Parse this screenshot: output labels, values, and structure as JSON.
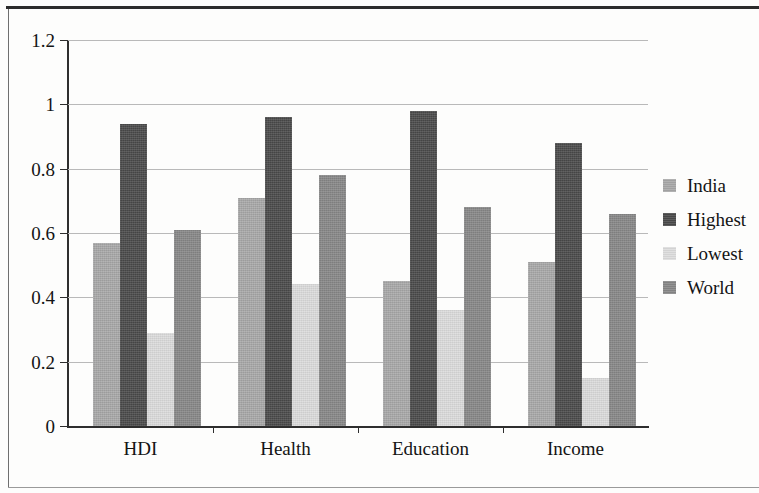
{
  "chart_data": {
    "type": "bar",
    "title": "",
    "xlabel": "",
    "ylabel": "",
    "categories": [
      "HDI",
      "Health",
      "Education",
      "Income"
    ],
    "series": [
      {
        "name": "India",
        "color": "#a8a8a8",
        "values": [
          0.57,
          0.71,
          0.45,
          0.51
        ]
      },
      {
        "name": "Highest",
        "color": "#4a4a4a",
        "values": [
          0.94,
          0.96,
          0.98,
          0.88
        ]
      },
      {
        "name": "Lowest",
        "color": "#dcdcdc",
        "values": [
          0.29,
          0.44,
          0.36,
          0.15
        ]
      },
      {
        "name": "World",
        "color": "#878787",
        "values": [
          0.61,
          0.78,
          0.68,
          0.66
        ]
      }
    ],
    "ylim": [
      0,
      1.2
    ],
    "yticks": [
      0,
      0.2,
      0.4,
      0.6,
      0.8,
      1,
      1.2
    ],
    "ytick_labels": [
      "0",
      "0.2",
      "0.4",
      "0.6",
      "0.8",
      "1",
      "1.2"
    ],
    "grid": true,
    "legend_position": "right"
  }
}
